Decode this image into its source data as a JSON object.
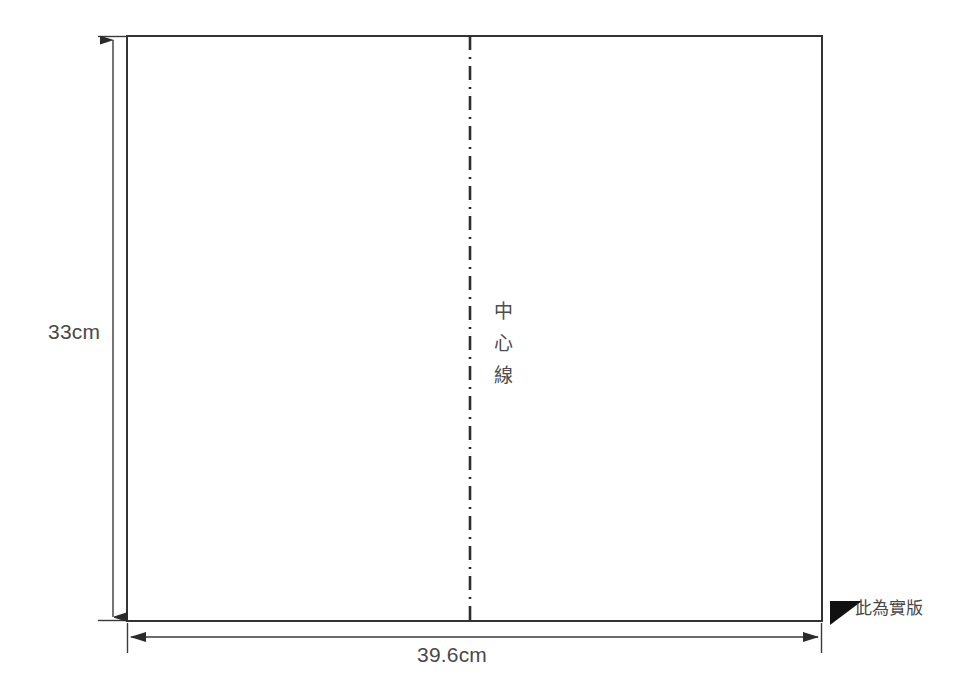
{
  "diagram": {
    "type": "technical-dimension-drawing",
    "title": "",
    "canvas": {
      "width": 976,
      "height": 699,
      "background": "#ffffff"
    },
    "panel": {
      "name": "sheet-rectangle",
      "x": 127,
      "y": 36,
      "width": 695,
      "height": 585,
      "fill": "#ffffff",
      "stroke": "#333333",
      "stroke_width": 2
    },
    "center_line": {
      "label_chars": [
        "中",
        "心",
        "線"
      ],
      "label_text": "中心線",
      "x": 470,
      "y_start": 36,
      "y_end": 621,
      "style": "dash-dot",
      "color": "#2e2e2e"
    },
    "dimensions": [
      {
        "name": "height-dimension",
        "label": "33cm",
        "value": 33,
        "unit": "cm",
        "orientation": "vertical",
        "axis_x": 113,
        "from_y": 36,
        "to_y": 621,
        "color": "#4a4a4a"
      },
      {
        "name": "width-dimension",
        "label": "39.6cm",
        "value": 39.6,
        "unit": "cm",
        "orientation": "horizontal",
        "axis_y": 637,
        "from_x": 127,
        "to_x": 822,
        "color": "#4a4a4a"
      }
    ],
    "notes": [
      {
        "name": "actual-size-note",
        "marker": "filled-triangle-flag-icon",
        "marker_color": "#111111",
        "text": "此為實版"
      }
    ],
    "colors": {
      "outline": "#333333",
      "dimension": "#4a4a4a",
      "centerline": "#2e2e2e",
      "text": "#464646",
      "background": "#ffffff"
    }
  }
}
